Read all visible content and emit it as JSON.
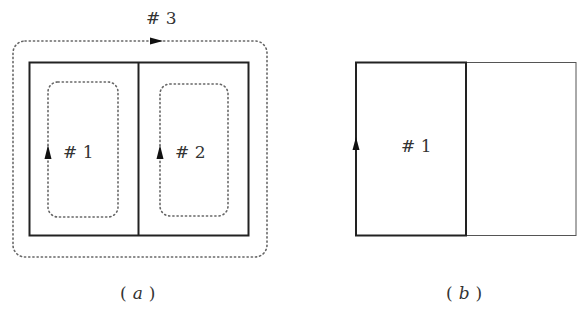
{
  "figure_a": {
    "caption_open": "(",
    "caption_letter": "a",
    "caption_close": ")",
    "loops": [
      {
        "label": "# 1",
        "style": "dotted",
        "arrow": "up"
      },
      {
        "label": "# 2",
        "style": "dotted",
        "arrow": "up"
      },
      {
        "label": "# 3",
        "style": "dotted",
        "arrow": "right"
      }
    ]
  },
  "figure_b": {
    "caption_open": "(",
    "caption_letter": "b",
    "caption_close": ")",
    "loop_label": "# 1",
    "arrow": "up"
  },
  "colors": {
    "line": "#222222",
    "thin_line": "#555555",
    "dots": "#666666",
    "text": "#333333"
  }
}
